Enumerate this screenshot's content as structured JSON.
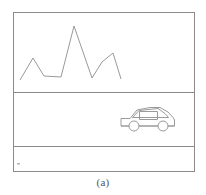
{
  "figure": {
    "caption": "(a)",
    "colors": {
      "background": "#ffffff",
      "frame_stroke": "#8c8c8c",
      "divider_stroke": "#8a8a8a",
      "mountain_stroke": "#9a9a9a",
      "car_stroke": "#9a9a9a",
      "caption_text": "#555555"
    },
    "frame": {
      "x": 13,
      "y": 12,
      "width": 182,
      "height": 160,
      "stroke_width": 1
    },
    "bands": [
      {
        "name": "sky-band",
        "top": 12,
        "bottom": 92,
        "content": "mountain-range"
      },
      {
        "name": "ground-band",
        "top": 92,
        "bottom": 146,
        "content": "car"
      },
      {
        "name": "foreground-band",
        "top": 146,
        "bottom": 172,
        "content": "empty"
      }
    ],
    "dividers": [
      {
        "name": "horizon-divider",
        "y": 92
      },
      {
        "name": "lower-divider",
        "y": 146
      }
    ],
    "mountain": {
      "name": "mountain-range-polyline",
      "points": "20,80 33,58 44,76 61,77 74,26 92,78 102,62 113,53 121,79"
    },
    "car": {
      "name": "car-outline",
      "body_path": "M122,126 L122,119 L130,119 L138,110 L158,107 L168,113 L172,118 L174,120 L174,126 L166,126 L164,126 L142,126 L138,126 L130,126 Z",
      "roof_path": "M133,117 L140,111 L157,109 L164,114 L167,117 Z",
      "window_rect": {
        "x": 139,
        "y": 112,
        "width": 18,
        "height": 8
      },
      "wheels": [
        {
          "name": "front-wheel",
          "cx": 134,
          "cy": 126,
          "r": 5
        },
        {
          "name": "rear-wheel",
          "cx": 163,
          "cy": 126,
          "r": 5
        }
      ]
    },
    "artifact": {
      "name": "speck-mark",
      "x": 17,
      "y": 163,
      "width": 3,
      "height": 2
    }
  }
}
